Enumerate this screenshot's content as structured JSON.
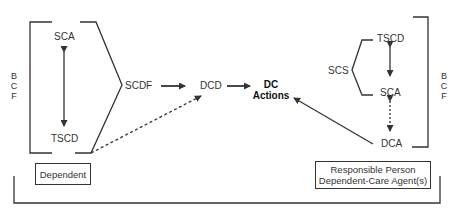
{
  "left_group": {
    "side_label": [
      "B",
      "C",
      "F"
    ],
    "top_node": "SCA",
    "bottom_node": "TSCD",
    "box_label": "Dependent"
  },
  "center": {
    "scdf": "SCDF",
    "dcd": "DCD",
    "dc_actions_line1": "DC",
    "dc_actions_line2": "Actions"
  },
  "right_group": {
    "side_label": [
      "B",
      "C",
      "F"
    ],
    "scs": "SCS",
    "top_node": "TSCD",
    "middle_node": "SCA",
    "bottom_node": "DCA",
    "box_line1": "Responsible Person",
    "box_line2": "Dependent-Care Agent(s)"
  },
  "colors": {
    "line": "#333333",
    "background": "#ffffff"
  }
}
